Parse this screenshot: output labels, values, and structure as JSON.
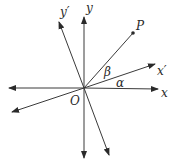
{
  "diagram": {
    "origin": {
      "label": "O",
      "x": 84,
      "y": 88
    },
    "axes": [
      {
        "name": "x",
        "label": "x",
        "from": [
          9,
          88
        ],
        "to": [
          158,
          89
        ],
        "label_pos": [
          161,
          97
        ]
      },
      {
        "name": "y",
        "label": "y",
        "from": [
          84,
          158
        ],
        "to": [
          84,
          17
        ],
        "label_pos": [
          86,
          12
        ]
      },
      {
        "name": "x-prime",
        "label": "x′",
        "from": [
          12,
          112
        ],
        "to": [
          155,
          64
        ],
        "label_pos": [
          158,
          75
        ]
      },
      {
        "name": "y-prime",
        "label": "y′",
        "from": [
          109,
          155
        ],
        "to": [
          59,
          22
        ],
        "label_pos": [
          60,
          15
        ]
      }
    ],
    "point": {
      "label": "P",
      "x": 133,
      "y": 33,
      "label_pos": [
        136,
        30
      ]
    },
    "angles": [
      {
        "name": "alpha",
        "label": "α",
        "pos": [
          117,
          87
        ]
      },
      {
        "name": "beta",
        "label": "β",
        "pos": [
          104,
          76
        ]
      }
    ],
    "colors": {
      "line": "#3a3a3a",
      "text": "#2a2a2a",
      "background": "#ffffff"
    }
  }
}
